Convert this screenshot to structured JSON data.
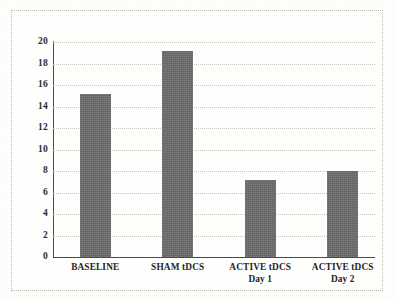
{
  "chart_data": {
    "type": "bar",
    "title": "",
    "subtitle": "",
    "xlabel": "",
    "ylabel": "",
    "categories": [
      "BASELINE",
      "SHAM tDCS",
      "ACTIVE tDCS Day 1",
      "ACTIVE tDCS Day 2"
    ],
    "category_lines": [
      [
        "BASELINE"
      ],
      [
        "SHAM tDCS"
      ],
      [
        "ACTIVE tDCS",
        "Day 1"
      ],
      [
        "ACTIVE tDCS",
        "Day 2"
      ]
    ],
    "values": [
      15.2,
      19.2,
      7.2,
      8.0
    ],
    "ylim": [
      0,
      20
    ],
    "ytick_step": 2,
    "yticks": [
      0,
      2,
      4,
      6,
      8,
      10,
      12,
      14,
      16,
      18,
      20
    ],
    "ytick_labels": [
      "0",
      "2",
      "4",
      "6",
      "8",
      "10",
      "12",
      "14",
      "16",
      "18",
      "20"
    ],
    "grid": true,
    "grid_axis": "y",
    "grid_style": "dotted",
    "legend": false,
    "legend_position": "none",
    "bar_color": "#6d6d6d",
    "axis_color": "#4a4a4a",
    "gridline_color": "#c9c9c4",
    "plot_background": "#fefefc",
    "figure_background": "#fdfdfb",
    "border_color": "#b9b9b3",
    "annotations": []
  }
}
